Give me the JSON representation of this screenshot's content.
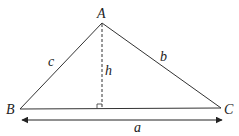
{
  "diagram": {
    "type": "triangle-with-altitude",
    "vertices": {
      "A": {
        "label": "A",
        "x": 102,
        "y": 23
      },
      "B": {
        "label": "B",
        "x": 20,
        "y": 109
      },
      "C": {
        "label": "C",
        "x": 221,
        "y": 108
      }
    },
    "sides": {
      "a": {
        "label": "a"
      },
      "b": {
        "label": "b"
      },
      "c": {
        "label": "c"
      }
    },
    "altitude": {
      "label": "h"
    },
    "colors": {
      "stroke": "#333333",
      "background": "#ffffff"
    }
  }
}
